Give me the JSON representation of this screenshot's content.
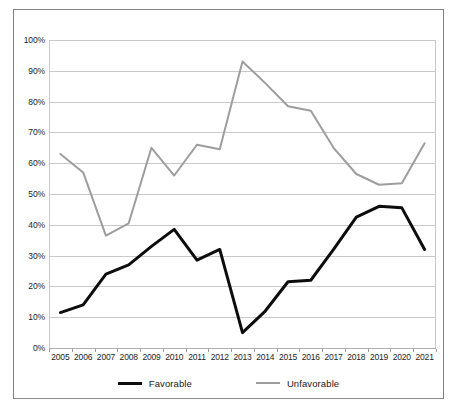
{
  "chart_data": {
    "type": "line",
    "title": "",
    "xlabel": "",
    "ylabel": "",
    "ylim": [
      0,
      100
    ],
    "yticks": [
      "0%",
      "10%",
      "20%",
      "30%",
      "40%",
      "50%",
      "60%",
      "70%",
      "80%",
      "90%",
      "100%"
    ],
    "ytick_values": [
      0,
      10,
      20,
      30,
      40,
      50,
      60,
      70,
      80,
      90,
      100
    ],
    "grid": true,
    "legend_position": "bottom",
    "categories": [
      "2005",
      "2006",
      "2007",
      "2008",
      "2009",
      "2010",
      "2011",
      "2012",
      "2013",
      "2014",
      "2015",
      "2016",
      "2017",
      "2018",
      "2019",
      "2020",
      "2021"
    ],
    "series": [
      {
        "name": "Favorable",
        "color": "#0d0d0d",
        "width": 3,
        "values": [
          11.5,
          14,
          24,
          27,
          33,
          38.5,
          28.5,
          32,
          5,
          12,
          21.5,
          22,
          32,
          42.5,
          46,
          45.5,
          32
        ]
      },
      {
        "name": "Unfavorable",
        "color": "#9d9d9d",
        "width": 2,
        "values": [
          63,
          57,
          36.5,
          40.5,
          65,
          56,
          66,
          64.5,
          93,
          86,
          78.5,
          77,
          65,
          56.5,
          53,
          53.5,
          66.5
        ]
      }
    ]
  },
  "legend": {
    "items": [
      {
        "label": "Favorable"
      },
      {
        "label": "Unfavorable"
      }
    ]
  },
  "colors": {
    "favorable": "#0d0d0d",
    "unfavorable": "#9d9d9d",
    "grid": "#c9c9c9",
    "border": "#7f7f7f",
    "background": "#ffffff"
  }
}
